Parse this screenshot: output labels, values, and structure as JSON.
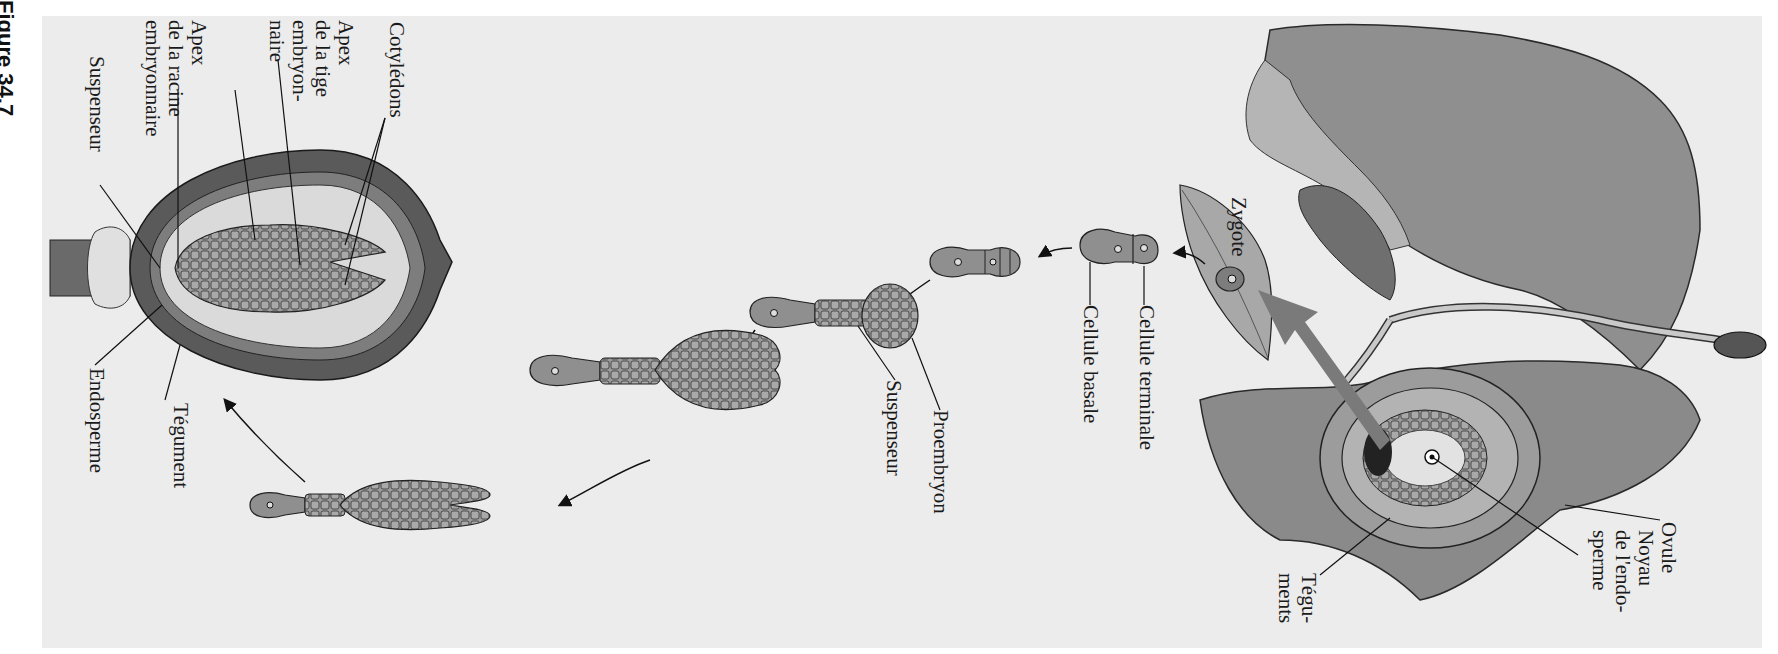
{
  "figure": {
    "caption": "Figure 34.7",
    "orientation": "rotated 90° clockwise",
    "background": "#ececec",
    "arrow_color": "#7a7a7a"
  },
  "stages": [
    {
      "id": "flower",
      "desc": "Fleur avec ovule en coupe"
    },
    {
      "id": "zygote",
      "desc": "Zygote"
    },
    {
      "id": "two-cell",
      "desc": "Embryon à deux cellules"
    },
    {
      "id": "four-cell",
      "desc": "Embryon à quatre cellules"
    },
    {
      "id": "proembryo",
      "desc": "Proembryon et suspenseur"
    },
    {
      "id": "globular",
      "desc": "Embryon globulaire/cordiforme"
    },
    {
      "id": "torpedo",
      "desc": "Embryon en torpille"
    },
    {
      "id": "seed",
      "desc": "Graine mature"
    }
  ],
  "labels": {
    "ovule": "Ovule",
    "noyau": [
      "Noyau",
      "de l'endo-",
      "sperme"
    ],
    "teguments": [
      "Tégu-",
      "ments"
    ],
    "zygote": "Zygote",
    "cellule_terminale": "Cellule terminale",
    "cellule_basale": "Cellule basale",
    "proembryon": "Proembryon",
    "suspenseur_mid": "Suspenseur",
    "cotyledons": "Cotylédons",
    "apex_tige": [
      "Apex",
      "de la tige",
      "embryon-",
      "naire"
    ],
    "apex_racine": [
      "Apex",
      "de la racine",
      "embryonnaire"
    ],
    "suspenseur_seed": "Suspenseur",
    "endosperme": "Endosperme",
    "tegument": "Tégument"
  }
}
